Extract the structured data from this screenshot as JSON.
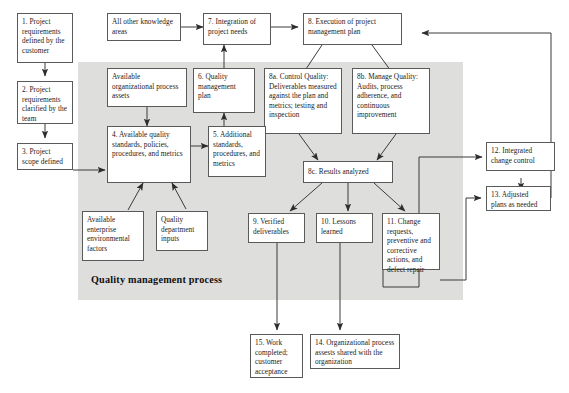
{
  "diagram": {
    "process_region_label": "Quality management process",
    "colors": {
      "process_region_fill": "#dededd",
      "node_border": "#5a5a5a",
      "node_fill": "#ffffff",
      "connector": "#3a3a3a",
      "text": "#1a1a1a"
    },
    "nodes": [
      {
        "id": "n1",
        "label": "1. Project requirements defined by the customer"
      },
      {
        "id": "n2",
        "label": "2. Project requirements clarified by the team"
      },
      {
        "id": "n3",
        "label": "3. Project scope defined"
      },
      {
        "id": "nall",
        "label": "All other knowledge areas"
      },
      {
        "id": "n7",
        "label": "7. Integration of project needs"
      },
      {
        "id": "n8",
        "label": "8. Execution of project management plan"
      },
      {
        "id": "nopa",
        "label": "Available organizational process assets"
      },
      {
        "id": "n6",
        "label": "6. Quality management plan"
      },
      {
        "id": "n8a",
        "label": "8a. Control Quality: Deliverables measured against the plan and metrics; testing and inspection"
      },
      {
        "id": "n8b",
        "label": "8b. Manage Quality: Audits, process adherence, and continuous improvement"
      },
      {
        "id": "n4",
        "label": "4. Available quality standards, policies, procedures, and metrics"
      },
      {
        "id": "n5",
        "label": "5. Additional standards, procedures, and metrics"
      },
      {
        "id": "n8c",
        "label": "8c. Results analyzed"
      },
      {
        "id": "n12",
        "label": "12. Integrated change control"
      },
      {
        "id": "naef",
        "label": "Available enterprise environmental factors"
      },
      {
        "id": "nqdi",
        "label": "Quality department inputs"
      },
      {
        "id": "n9",
        "label": "9. Verified deliverables"
      },
      {
        "id": "n10",
        "label": "10. Lessons learned"
      },
      {
        "id": "n11",
        "label": "11. Change requests, preventive and corrective actions, and defect repair"
      },
      {
        "id": "n13",
        "label": "13. Adjusted plans as needed"
      },
      {
        "id": "n15",
        "label": "15. Work completed; customer acceptance"
      },
      {
        "id": "n14",
        "label": "14. Organizational process assests shared with the organization"
      }
    ],
    "edges": [
      {
        "from": "n1",
        "to": "n2"
      },
      {
        "from": "n2",
        "to": "n3"
      },
      {
        "from": "n3",
        "to": "n4"
      },
      {
        "from": "nall",
        "to": "n7"
      },
      {
        "from": "n7",
        "to": "n8"
      },
      {
        "from": "nopa",
        "to": "n4"
      },
      {
        "from": "n4",
        "to": "n5"
      },
      {
        "from": "n5",
        "to": "n6"
      },
      {
        "from": "n6",
        "to": "n7"
      },
      {
        "from": "naef",
        "to": "n4"
      },
      {
        "from": "nqdi",
        "to": "n4"
      },
      {
        "from": "n8",
        "to": "n8a"
      },
      {
        "from": "n8",
        "to": "n8b"
      },
      {
        "from": "n8a",
        "to": "n8c"
      },
      {
        "from": "n8b",
        "to": "n8c"
      },
      {
        "from": "n8c",
        "to": "n9"
      },
      {
        "from": "n8c",
        "to": "n10"
      },
      {
        "from": "n8c",
        "to": "n11"
      },
      {
        "from": "n9",
        "to": "n15"
      },
      {
        "from": "n10",
        "to": "n14"
      },
      {
        "from": "n11",
        "to": "n12"
      },
      {
        "from": "n11",
        "to": "n13"
      },
      {
        "from": "n12",
        "to": "n13"
      },
      {
        "from": "n13",
        "to": "n8"
      }
    ]
  }
}
